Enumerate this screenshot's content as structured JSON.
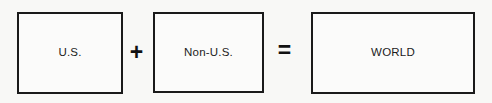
{
  "diagram": {
    "type": "equation-block-diagram",
    "background_color": "#f8f8f6",
    "border_color": "#1a1a1a",
    "text_color": "#1c1c1c",
    "boxes": [
      {
        "id": "us",
        "label": "U.S."
      },
      {
        "id": "non-us",
        "label": "Non-U.S."
      },
      {
        "id": "world",
        "label": "WORLD"
      }
    ],
    "operators": [
      {
        "id": "plus",
        "symbol": "+",
        "name": "plus-sign"
      },
      {
        "id": "equals",
        "symbol": "=",
        "name": "equals-sign"
      }
    ]
  }
}
